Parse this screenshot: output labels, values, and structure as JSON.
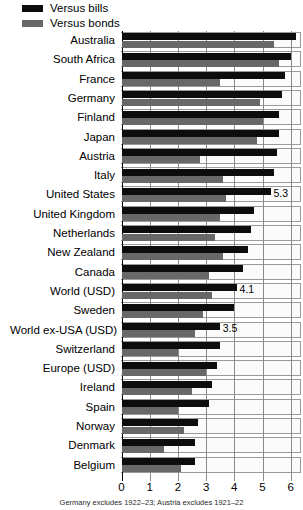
{
  "legend": {
    "items": [
      {
        "label": "Versus bills",
        "color": "#0d0d0d",
        "key": "bills"
      },
      {
        "label": "Versus bonds",
        "color": "#686868",
        "key": "bonds"
      }
    ]
  },
  "axis": {
    "ticks": [
      "0",
      "1",
      "2",
      "3",
      "4",
      "5",
      "6"
    ],
    "min": 0,
    "max": 6.4
  },
  "footnote": "Germany excludes 1922–23; Austria excludes 1921–22",
  "chart_data": {
    "type": "bar",
    "orientation": "horizontal",
    "title": "",
    "xlabel": "",
    "ylabel": "",
    "xlim": [
      0,
      6.4
    ],
    "grid": true,
    "legend_position": "top-left",
    "categories": [
      "Australia",
      "South Africa",
      "France",
      "Germany",
      "Finland",
      "Japan",
      "Austria",
      "Italy",
      "United States",
      "United Kingdom",
      "Netherlands",
      "New Zealand",
      "Canada",
      "World (USD)",
      "Sweden",
      "World ex-USA (USD)",
      "Switzerland",
      "Europe (USD)",
      "Ireland",
      "Spain",
      "Norway",
      "Denmark",
      "Belgium"
    ],
    "series": [
      {
        "name": "Versus bills",
        "color": "#0d0d0d",
        "values": [
          6.2,
          6.0,
          5.8,
          5.7,
          5.6,
          5.6,
          5.5,
          5.4,
          5.3,
          4.7,
          4.6,
          4.5,
          4.3,
          4.1,
          4.0,
          3.5,
          3.5,
          3.4,
          3.2,
          3.1,
          2.7,
          2.6,
          2.6
        ]
      },
      {
        "name": "Versus bonds",
        "color": "#686868",
        "values": [
          5.4,
          5.6,
          3.5,
          4.9,
          5.0,
          4.8,
          2.8,
          3.6,
          3.7,
          3.5,
          3.3,
          3.6,
          3.1,
          3.2,
          2.9,
          2.6,
          2.0,
          3.0,
          2.5,
          2.0,
          2.2,
          1.5,
          2.1
        ]
      }
    ],
    "point_labels": [
      {
        "category": "United States",
        "series": "Versus bills",
        "text": "5.3"
      },
      {
        "category": "World (USD)",
        "series": "Versus bills",
        "text": "4.1"
      },
      {
        "category": "World ex-USA (USD)",
        "series": "Versus bills",
        "text": "3.5"
      }
    ]
  }
}
